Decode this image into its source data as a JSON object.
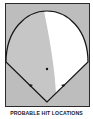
{
  "diagram": {
    "type": "baseball-field-hit-distribution",
    "colors": {
      "background": "#bdbdbd",
      "frame": "#2a2a2a",
      "outline": "#151515",
      "high_probability_region": "#c4c4c4",
      "low_probability_region": "#ffffff",
      "markers": "#111111"
    },
    "markers": [
      {
        "name": "pitchers-mound",
        "x": 47,
        "y": 69
      },
      {
        "name": "first-base-line-marker",
        "x": 63,
        "y": 85
      },
      {
        "name": "third-base-line-marker",
        "x": 31,
        "y": 85
      }
    ]
  },
  "caption": "PROBABLE HIT LOCATIONS"
}
